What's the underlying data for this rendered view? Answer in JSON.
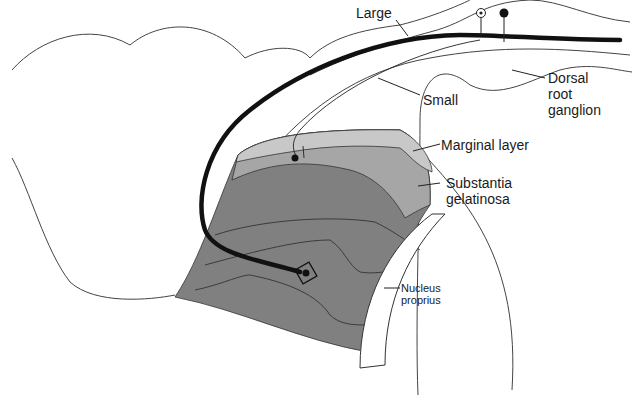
{
  "figure": {
    "labels": {
      "large": "Large",
      "small": "Small",
      "dorsal_root_ganglion": [
        "Dorsal",
        "root",
        "ganglion"
      ],
      "marginal_layer": "Marginal layer",
      "substantia_gelatinosa": [
        "Substantia",
        "gelatinosa"
      ],
      "nucleus_proprius": [
        "Nucleus",
        "proprius"
      ]
    },
    "colors": {
      "outline": "#3a3a3a",
      "large_fiber": "#111111",
      "marginal_layer_fill": "#c8c8c8",
      "substantia_gelatinosa_fill": "#a6a6a6",
      "deep_laminae_fill": "#808080"
    }
  }
}
